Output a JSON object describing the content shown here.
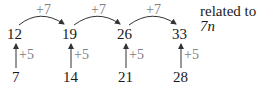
{
  "diagram": {
    "title_prefix": "related to ",
    "title_expr": "7n",
    "top_row": [
      "12",
      "19",
      "26",
      "33"
    ],
    "bottom_row": [
      "7",
      "14",
      "21",
      "28"
    ],
    "horizontal_step": "+7",
    "vertical_step": "+5",
    "colors": {
      "text": "#1a1a1a",
      "step_label": "#808080",
      "arrow": "#333333"
    }
  }
}
